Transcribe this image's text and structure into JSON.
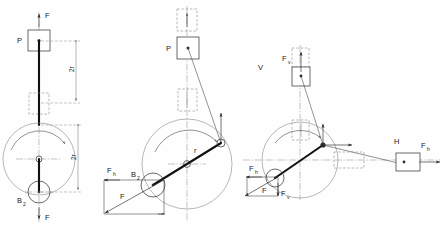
{
  "figure": {
    "background_color": "#fefefe",
    "line_color": "#2b2b2b",
    "panels": [
      {
        "id": "panel-left",
        "name": "dead-centre-position",
        "labels": {
          "force_top": "F",
          "force_bottom": "F",
          "piston": "P",
          "crank_pin": "B",
          "crank_pin_sub": "2",
          "dim_upper": "2r",
          "dim_lower": "2r"
        }
      },
      {
        "id": "panel-middle",
        "name": "inclined-crank-position",
        "labels": {
          "piston": "P",
          "crank_pin": "B",
          "crank_pin_sub": "2",
          "force_horizontal": "F",
          "force_horizontal_sub": "h",
          "force_resultant": "F",
          "crank_radius": "r"
        }
      },
      {
        "id": "panel-right",
        "name": "resolved-components-position",
        "labels": {
          "vertical_axis": "V",
          "horizontal_axis": "H",
          "force_vertical_top": "F",
          "force_vertical_top_sub": "v",
          "force_horizontal_right": "F",
          "force_horizontal_right_sub": "h",
          "force_horizontal_left": "F",
          "force_horizontal_left_sub": "h",
          "force_vertical_low": "F",
          "force_vertical_low_sub": "v",
          "force_resultant": "F"
        }
      }
    ]
  }
}
